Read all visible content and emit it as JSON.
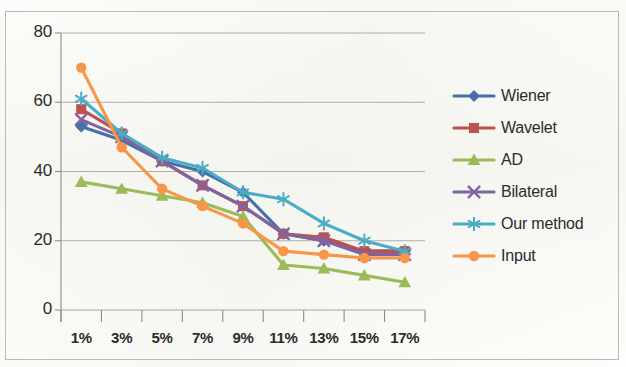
{
  "chart_data": {
    "type": "line",
    "title": "",
    "xlabel": "",
    "ylabel": "",
    "categories": [
      "1%",
      "3%",
      "5%",
      "7%",
      "9%",
      "11%",
      "13%",
      "15%",
      "17%"
    ],
    "ylim": [
      0,
      80
    ],
    "yticks": [
      0,
      20,
      40,
      60,
      80
    ],
    "grid": true,
    "legend_position": "right",
    "series": [
      {
        "name": "Wiener",
        "color": "#4472A8",
        "marker": "diamond",
        "values": [
          53,
          49,
          43,
          40,
          34,
          22,
          20,
          17,
          17
        ]
      },
      {
        "name": "Wavelet",
        "color": "#C0504D",
        "marker": "square",
        "values": [
          58,
          51,
          43,
          36,
          30,
          22,
          21,
          17,
          17
        ]
      },
      {
        "name": "AD",
        "color": "#9BBB59",
        "marker": "triangle",
        "values": [
          37,
          35,
          33,
          31,
          27,
          13,
          12,
          10,
          8
        ]
      },
      {
        "name": "Bilateral",
        "color": "#8064A2",
        "marker": "x",
        "values": [
          55,
          50,
          43,
          36,
          30,
          22,
          20,
          16,
          16
        ]
      },
      {
        "name": "Our method",
        "color": "#4BACC6",
        "marker": "asterisk",
        "values": [
          61,
          51,
          44,
          41,
          34,
          32,
          25,
          20,
          17
        ]
      },
      {
        "name": "Input",
        "color": "#F79646",
        "marker": "circle",
        "values": [
          70,
          47,
          35,
          30,
          25,
          17,
          16,
          15,
          15
        ]
      }
    ]
  }
}
